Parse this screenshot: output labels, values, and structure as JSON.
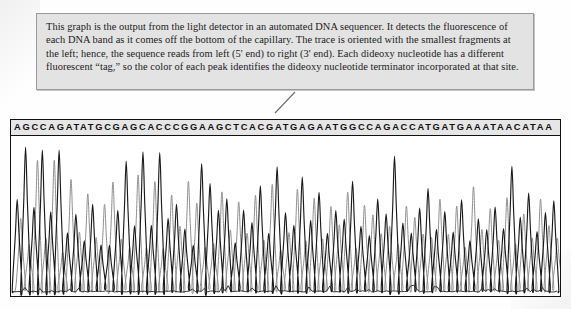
{
  "figure": {
    "caption": "This graph is the output from the light detector in an automated DNA sequencer. It detects the fluorescence of each DNA band as it comes off the bottom of the capillary. The trace is oriented with the smallest fragments at the left; hence, the sequence reads from left (5' end) to right (3' end). Each dideoxy nucleotide has a different fluorescent “tag,” so the color of each peak identifies the dideoxy nucleotide terminator incorporated at that site.",
    "colors": {
      "caption_background": "#e3e3e3",
      "caption_border": "#9a9a9a",
      "caption_text": "#1b1b1b",
      "panel_border": "#111111",
      "sequence_strip_background": "#e6e6e6",
      "trace_dark": "#1a1a1a",
      "trace_light": "#8e8e8e",
      "page_background": "#fefefe"
    }
  },
  "chart_data": {
    "type": "line",
    "title": "",
    "subtitle": "",
    "xlabel": "",
    "ylabel": "",
    "grid": false,
    "legend_position": "none",
    "sequence": "AGCCAGATATGCGAGCACCCGGAAGCTCACGATGAGAATGGCCAGACCATGATGAAATAACATAA",
    "base_count": 65,
    "bases": [
      "A",
      "G",
      "C",
      "C",
      "A",
      "G",
      "A",
      "T",
      "A",
      "T",
      "G",
      "C",
      "G",
      "A",
      "G",
      "C",
      "A",
      "C",
      "C",
      "C",
      "G",
      "G",
      "A",
      "A",
      "G",
      "C",
      "T",
      "C",
      "A",
      "C",
      "G",
      "A",
      "T",
      "G",
      "A",
      "G",
      "A",
      "A",
      "T",
      "G",
      "G",
      "C",
      "C",
      "A",
      "G",
      "A",
      "C",
      "C",
      "A",
      "T",
      "G",
      "A",
      "T",
      "G",
      "A",
      "A",
      "A",
      "T",
      "A",
      "A",
      "C",
      "A",
      "T",
      "A",
      "A"
    ],
    "ylim": [
      0,
      1
    ],
    "series": [
      {
        "name": "dark-trace",
        "color": "#1a1a1a",
        "peak_heights": [
          0.62,
          0.95,
          0.58,
          0.97,
          0.55,
          0.93,
          0.4,
          0.52,
          0.36,
          0.58,
          0.33,
          0.3,
          0.52,
          0.88,
          0.46,
          0.95,
          0.44,
          0.93,
          0.5,
          0.6,
          0.42,
          0.3,
          0.86,
          0.74,
          0.55,
          0.62,
          0.34,
          0.56,
          0.46,
          0.7,
          0.4,
          0.82,
          0.52,
          0.44,
          0.78,
          0.5,
          0.66,
          0.38,
          0.56,
          0.48,
          0.72,
          0.42,
          0.36,
          0.6,
          0.54,
          0.9,
          0.48,
          0.38,
          0.55,
          0.7,
          0.44,
          0.52,
          0.4,
          0.62,
          0.36,
          0.5,
          0.44,
          0.58,
          0.42,
          0.86,
          0.48,
          0.66,
          0.4,
          0.54,
          0.62
        ]
      },
      {
        "name": "light-trace",
        "color": "#8e8e8e",
        "peak_heights": [
          0.48,
          0.3,
          0.86,
          0.34,
          0.9,
          0.28,
          0.74,
          0.4,
          0.66,
          0.36,
          0.58,
          0.72,
          0.34,
          0.3,
          0.8,
          0.32,
          0.72,
          0.3,
          0.64,
          0.44,
          0.76,
          0.6,
          0.32,
          0.3,
          0.68,
          0.4,
          0.6,
          0.38,
          0.66,
          0.34,
          0.74,
          0.3,
          0.42,
          0.7,
          0.32,
          0.6,
          0.34,
          0.56,
          0.44,
          0.66,
          0.3,
          0.58,
          0.52,
          0.38,
          0.44,
          0.3,
          0.56,
          0.5,
          0.4,
          0.34,
          0.62,
          0.38,
          0.58,
          0.3,
          0.7,
          0.42,
          0.54,
          0.36,
          0.62,
          0.3,
          0.52,
          0.34,
          0.64,
          0.46,
          0.38
        ]
      }
    ],
    "baseline_noise": true
  }
}
